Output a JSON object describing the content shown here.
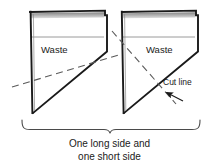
{
  "diagram": {
    "shapes": [
      {
        "id": "left-piece",
        "waste_label": "Waste"
      },
      {
        "id": "right-piece",
        "waste_label": "Waste"
      }
    ],
    "annotations": {
      "cut_line_label": "Cut line"
    },
    "caption": {
      "line1": "One long side and",
      "line2": "one short side"
    },
    "colors": {
      "outline": "#1a1a1a",
      "waste_divider": "#9a9a9a",
      "shade_band": "#8f8f8f",
      "dashed_line": "#5a5a5a",
      "brace": "#4a4a4a",
      "text": "#1a1a1a",
      "background": "#ffffff"
    }
  }
}
